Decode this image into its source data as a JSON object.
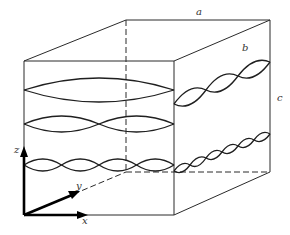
{
  "figure": {
    "labels": {
      "a": "a",
      "b": "b",
      "c": "c",
      "x": "x",
      "y": "y",
      "z": "z"
    },
    "front_face_waves": [
      {
        "name": "mode-1",
        "half_wavelengths": 1
      },
      {
        "name": "mode-2",
        "half_wavelengths": 2
      },
      {
        "name": "mode-4",
        "half_wavelengths": 4
      }
    ],
    "side_face_waves": [
      {
        "name": "side-mode-upper",
        "half_wavelengths": 3
      },
      {
        "name": "side-mode-lower",
        "half_wavelengths": 6
      }
    ],
    "colors": {
      "line": "#2a2a2a",
      "axis": "#000000",
      "background": "#ffffff"
    }
  }
}
